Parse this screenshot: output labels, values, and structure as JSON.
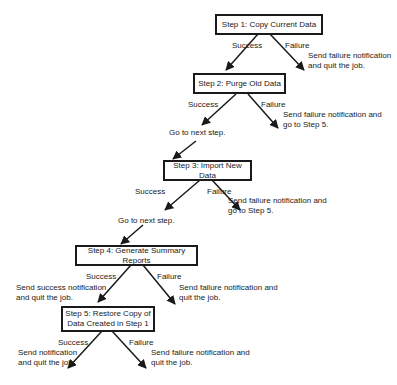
{
  "steps": [
    {
      "label": "Step 1: Copy Current Data",
      "success_label": "Success",
      "failure_label": "Failure",
      "failure_note": "Send failure notification\nand quit the job."
    },
    {
      "label": "Step 2: Purge Old Data",
      "success_label": "Success",
      "failure_label": "Failure",
      "success_note": "Go to next step.",
      "failure_note": "Send failure notification and\ngo to Step 5."
    },
    {
      "label": "Step 3: Import New Data",
      "success_label": "Success",
      "failure_label": "Failure",
      "success_note": "Go to next step.",
      "failure_note": "Send failure notification and\ngo to Step 5."
    },
    {
      "label": "Step 4: Generate Summary Reports",
      "success_label": "Success",
      "failure_label": "Failure",
      "success_note": "Send success notification\nand quit the job.",
      "failure_note": "Send failure notification and\nquit the job."
    },
    {
      "label": "Step 5: Restore Copy of\nData Created in Step 1",
      "success_label": "Success",
      "failure_label": "Failure",
      "success_note": "Send notification\nand quit the job.",
      "failure_note": "Send failure notification and\nquit the job."
    }
  ]
}
